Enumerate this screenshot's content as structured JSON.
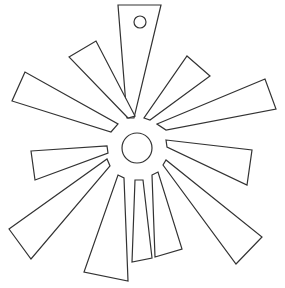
{
  "figure": {
    "width": 285,
    "height": 288,
    "stroke_color": "#333333",
    "fill_color": "#ffffff",
    "background": "#ffffff"
  },
  "center_circle": {
    "cx": 137,
    "cy": 148,
    "r": 15
  },
  "hanging_hole": {
    "cx": 140,
    "cy": 22,
    "r": 6
  },
  "rays": [
    {
      "id": "top",
      "points": "118,5 161,5 134,118 127,118"
    },
    {
      "id": "upper-left-1",
      "points": "69,57 96,41 135,116 128,118"
    },
    {
      "id": "upper-left-2",
      "points": "25,72 12,101 111,132 118,124"
    },
    {
      "id": "left",
      "points": "31,151 107,146 108,153 35,180"
    },
    {
      "id": "lower-left",
      "points": "9,229 107,159 110,166 31,259"
    },
    {
      "id": "bottom-left",
      "points": "118,175 124,178 128,281 84,272"
    },
    {
      "id": "bottom-center",
      "points": "135,180 143,180 152,258 132,262"
    },
    {
      "id": "bottom-right",
      "points": "152,175 158,172 182,249 155,257"
    },
    {
      "id": "lower-right",
      "points": "163,165 166,160 262,237 236,264"
    },
    {
      "id": "right",
      "points": "166,140 252,150 247,185 167,147"
    },
    {
      "id": "upper-right-2",
      "points": "157,124 265,79 276,109 166,130"
    },
    {
      "id": "upper-right-1",
      "points": "187,56 210,76 150,120 144,118"
    }
  ]
}
